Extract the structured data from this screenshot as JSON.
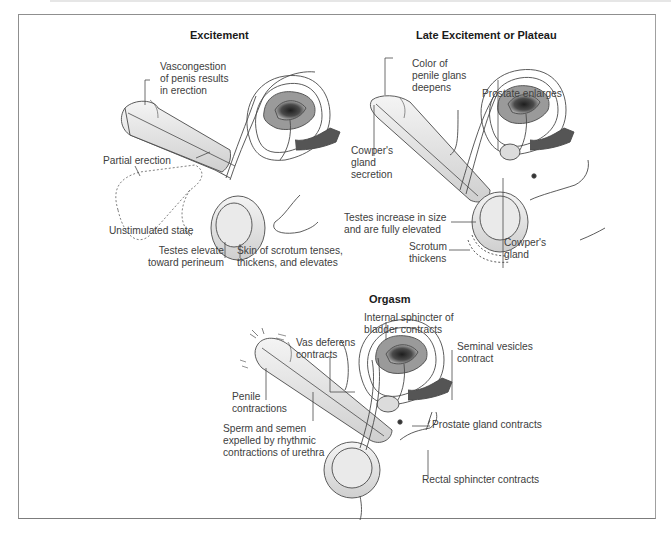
{
  "panels": [
    {
      "title": "Excitement",
      "labels": [
        "Vascongestion\nof penis results\nin erection",
        "Partial erection",
        "Unstimulated state",
        "Testes elevate\ntoward perineum",
        "Skin of scrotum tenses,\nthickens, and elevates"
      ]
    },
    {
      "title": "Late Excitement or Plateau",
      "labels": [
        "Color of\npenile glans\ndeepens",
        "Prostate enlarges",
        "Cowper's\ngland\nsecretion",
        "Testes increase in size\nand are fully elevated",
        "Scrotum\nthickens",
        "Cowper's\ngland"
      ]
    },
    {
      "title": "Orgasm",
      "labels": [
        "Internal sphincter of\nbladder contracts",
        "Vas deferens\ncontracts",
        "Seminal vesicles\ncontract",
        "Penile\ncontractions",
        "Sperm and semen\nexpelled by rhythmic\ncontractions of urethra",
        "Prostate gland contracts",
        "Rectal sphincter contracts"
      ]
    }
  ],
  "colors": {
    "frame": "#8f8f8f",
    "line": "#4a4a4a",
    "bladder_fill": "#9a9a9a",
    "bladder_dark": "#2a2a2a"
  }
}
